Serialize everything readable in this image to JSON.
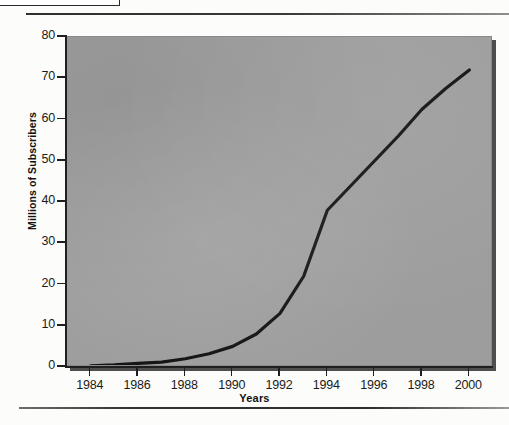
{
  "figure": {
    "caption_box_text": "",
    "running_head": "",
    "rule_top": "horizontal-rule",
    "rule_bottom": "horizontal-rule"
  },
  "chart_data": {
    "type": "line",
    "title": "",
    "xlabel": "Years",
    "ylabel": "Millions of Subscribers",
    "xlim": [
      1983,
      2001
    ],
    "ylim": [
      0,
      80
    ],
    "grid": false,
    "legend": null,
    "x_tick_labels": [
      "1984",
      "1986",
      "1988",
      "1990",
      "1992",
      "1994",
      "1996",
      "1998",
      "2000"
    ],
    "x_ticks": [
      1984,
      1986,
      1988,
      1990,
      1992,
      1994,
      1996,
      1998,
      2000
    ],
    "y_tick_labels": [
      "0",
      "10",
      "20",
      "30",
      "40",
      "50",
      "60",
      "70",
      "80"
    ],
    "y_ticks": [
      0,
      10,
      20,
      30,
      40,
      50,
      60,
      70,
      80
    ],
    "series": [
      {
        "name": "Millions of Subscribers",
        "color": "#111111",
        "x": [
          1984,
          1985,
          1986,
          1987,
          1988,
          1989,
          1990,
          1991,
          1992,
          1993,
          1994,
          1995,
          1996,
          1997,
          1998,
          1999,
          2000
        ],
        "values": [
          0.3,
          0.5,
          0.9,
          1.2,
          2.0,
          3.2,
          5.0,
          8.0,
          13.0,
          22.0,
          38.0,
          44.0,
          50.0,
          56.0,
          62.5,
          67.5,
          72.0
        ]
      }
    ]
  }
}
